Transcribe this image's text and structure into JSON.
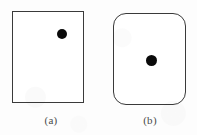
{
  "figure": {
    "background_color": "#fdfdfd",
    "stroke_color": "#3a3a3a",
    "dot_color": "#0a0a0a",
    "caption_color": "#4a4a4a",
    "panels": [
      {
        "id": "panel-a",
        "caption": "(a)",
        "shape": "sharp-cornered-rectangle",
        "corner_radius_px": 0,
        "box": {
          "x": 12,
          "y": 11,
          "width": 72,
          "height": 92
        },
        "dot": {
          "cx": 62,
          "cy": 34,
          "r": 5,
          "position_label": "upper-right"
        }
      },
      {
        "id": "panel-b",
        "caption": "(b)",
        "shape": "rounded-rectangle",
        "corner_radius_px": 13,
        "box": {
          "x": 113,
          "y": 13,
          "width": 73,
          "height": 92
        },
        "dot": {
          "cx": 151,
          "cy": 60,
          "r": 5.5,
          "position_label": "center"
        }
      }
    ]
  }
}
